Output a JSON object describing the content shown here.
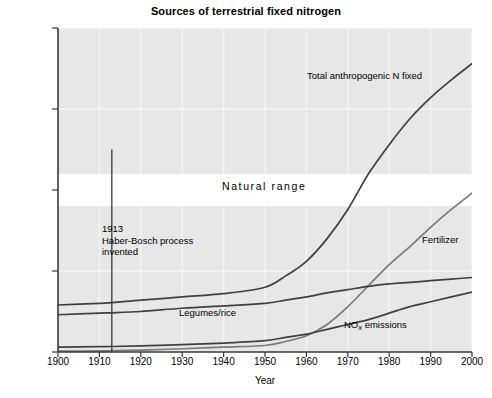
{
  "chart_data": {
    "type": "line",
    "title": "Sources of terrestrial fixed nitrogen",
    "xlabel": "Year",
    "ylabel": "Teragrams of nitrogen",
    "xlim": [
      1900,
      2000
    ],
    "ylim": [
      0,
      200
    ],
    "xticks": [
      1900,
      1910,
      1920,
      1930,
      1940,
      1950,
      1960,
      1970,
      1980,
      1990,
      2000
    ],
    "yticks": [
      0,
      50,
      100,
      150,
      200
    ],
    "grid": true,
    "legend_position": "inline-labels",
    "background_color": "#e7e7e7",
    "gridline_color": "#f4f4f4",
    "line_color": "#404040",
    "fertilizer_line_color": "#7a7a7a",
    "x": [
      1900,
      1910,
      1913,
      1920,
      1930,
      1940,
      1950,
      1955,
      1960,
      1965,
      1970,
      1975,
      1980,
      1985,
      1990,
      1995,
      2000
    ],
    "series": [
      {
        "name": "Total anthropogenic N fixed",
        "label": "Total anthropogenic N fixed",
        "color": "#404040",
        "values": [
          29,
          30,
          30.5,
          32,
          34,
          36,
          40,
          47,
          56,
          70,
          88,
          110,
          128,
          144,
          157,
          168,
          178
        ]
      },
      {
        "name": "Fertilizer",
        "label": "Fertilizer",
        "color": "#7a7a7a",
        "values": [
          0.5,
          0.7,
          0.8,
          1.2,
          2.0,
          3.0,
          4.0,
          6.5,
          10,
          17,
          28,
          41,
          54,
          65,
          77,
          88,
          98
        ]
      },
      {
        "name": "Legumes/rice",
        "label": "Legumes/rice",
        "color": "#404040",
        "values": [
          23,
          24,
          24.2,
          25,
          27,
          28.5,
          30,
          32,
          34,
          36.5,
          38.5,
          40.5,
          42,
          43,
          44,
          45,
          46
        ]
      },
      {
        "name": "NOx emissions",
        "label_prefix": "NO",
        "label_sub": "x",
        "label_suffix": " emissions",
        "color": "#404040",
        "values": [
          3,
          3.3,
          3.4,
          3.8,
          4.5,
          5.5,
          7,
          9,
          11,
          14,
          17,
          20,
          24,
          28,
          31,
          34,
          37
        ]
      }
    ],
    "bands": [
      {
        "name": "Natural range",
        "label": "Natural range",
        "y_low": 90,
        "y_high": 110,
        "color": "#ffffff"
      }
    ],
    "annotations": [
      {
        "name": "haber-bosch-marker",
        "line1": "1913",
        "line2": "Haber-Bosch process",
        "line3": "invented",
        "x_value": 1913,
        "marker_type": "vertical-line"
      }
    ]
  }
}
